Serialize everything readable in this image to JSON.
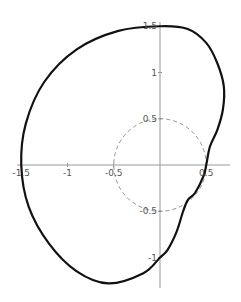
{
  "chart_data": {
    "type": "line",
    "subtype": "polar-curve",
    "title": "",
    "xlabel": "",
    "ylabel": "",
    "xlim": [
      -1.55,
      0.72
    ],
    "ylim": [
      -1.33,
      1.53
    ],
    "grid": false,
    "x_ticks": [
      {
        "value": -1.5,
        "label": "-1.5"
      },
      {
        "value": -1,
        "label": "-1"
      },
      {
        "value": -0.5,
        "label": "-0.5"
      },
      {
        "value": 0.5,
        "label": "0.5"
      }
    ],
    "y_ticks": [
      {
        "value": 1.5,
        "label": "1.5"
      },
      {
        "value": 1,
        "label": "1"
      },
      {
        "value": 0.5,
        "label": "0.5"
      },
      {
        "value": -0.5,
        "label": "-0.5"
      },
      {
        "value": -1,
        "label": "-1"
      }
    ],
    "series": [
      {
        "name": "curve",
        "style": "solid-thick",
        "color": "#111111",
        "points": [
          [
            0.0,
            1.5
          ],
          [
            0.3,
            1.47
          ],
          [
            0.5,
            1.32
          ],
          [
            0.62,
            1.1
          ],
          [
            0.69,
            0.85
          ],
          [
            0.68,
            0.6
          ],
          [
            0.62,
            0.38
          ],
          [
            0.54,
            0.2
          ],
          [
            0.5,
            0.0
          ],
          [
            0.47,
            -0.12
          ],
          [
            0.38,
            -0.3
          ],
          [
            0.3,
            -0.38
          ],
          [
            0.25,
            -0.5
          ],
          [
            0.18,
            -0.72
          ],
          [
            0.08,
            -0.92
          ],
          [
            0.0,
            -1.0
          ],
          [
            -0.18,
            -1.17
          ],
          [
            -0.56,
            -1.28
          ],
          [
            -0.9,
            -1.15
          ],
          [
            -1.2,
            -0.85
          ],
          [
            -1.42,
            -0.45
          ],
          [
            -1.5,
            0.0
          ],
          [
            -1.45,
            0.45
          ],
          [
            -1.25,
            0.9
          ],
          [
            -0.9,
            1.25
          ],
          [
            -0.45,
            1.45
          ],
          [
            0.0,
            1.5
          ]
        ]
      },
      {
        "name": "reference circle r=0.5",
        "style": "dashed",
        "color": "#777777",
        "radius": 0.5
      }
    ]
  }
}
